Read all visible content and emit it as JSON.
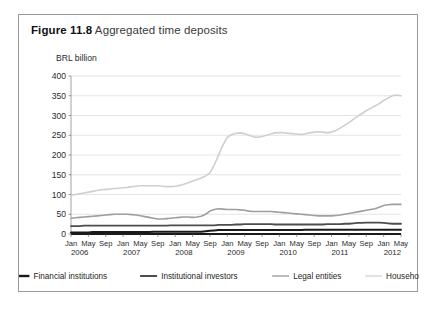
{
  "figure": {
    "label": "Figure 11.8",
    "title": "Aggregated time deposits"
  },
  "chart_data": {
    "type": "line",
    "title": "Aggregated time deposits",
    "xlabel": "",
    "ylabel": "BRL billion",
    "ylim": [
      0,
      400
    ],
    "ytick_step": 50,
    "yticks": [
      "0",
      "50",
      "100",
      "150",
      "200",
      "250",
      "300",
      "350",
      "400"
    ],
    "grid": true,
    "legend_position": "bottom",
    "colors": {
      "financial_institutions": "#1a1a1a",
      "institutional_investors": "#4d4d4d",
      "legal_entities": "#9e9e9e",
      "households": "#cfcfcf"
    },
    "x_tick_labels": [
      "Jan",
      "May",
      "Sep",
      "Jan",
      "May",
      "Sep",
      "Jan",
      "May",
      "Sep",
      "Jan",
      "May",
      "Sep",
      "Jan",
      "May",
      "Sep",
      "Jan",
      "May",
      "Sep",
      "Jan",
      "May"
    ],
    "x_year_labels": [
      "2006",
      "2007",
      "2008",
      "2009",
      "2010",
      "2011",
      "2012"
    ],
    "x_range_start": "Jan 2006",
    "x_range_end": "May 2012",
    "x_months": [
      "Jan 2006",
      "Feb 2006",
      "Mar 2006",
      "Apr 2006",
      "May 2006",
      "Jun 2006",
      "Jul 2006",
      "Aug 2006",
      "Sep 2006",
      "Oct 2006",
      "Nov 2006",
      "Dec 2006",
      "Jan 2007",
      "Feb 2007",
      "Mar 2007",
      "Apr 2007",
      "May 2007",
      "Jun 2007",
      "Jul 2007",
      "Aug 2007",
      "Sep 2007",
      "Oct 2007",
      "Nov 2007",
      "Dec 2007",
      "Jan 2008",
      "Feb 2008",
      "Mar 2008",
      "Apr 2008",
      "May 2008",
      "Jun 2008",
      "Jul 2008",
      "Aug 2008",
      "Sep 2008",
      "Oct 2008",
      "Nov 2008",
      "Dec 2008",
      "Jan 2009",
      "Feb 2009",
      "Mar 2009",
      "Apr 2009",
      "May 2009",
      "Jun 2009",
      "Jul 2009",
      "Aug 2009",
      "Sep 2009",
      "Oct 2009",
      "Nov 2009",
      "Dec 2009",
      "Jan 2010",
      "Feb 2010",
      "Mar 2010",
      "Apr 2010",
      "May 2010",
      "Jun 2010",
      "Jul 2010",
      "Aug 2010",
      "Sep 2010",
      "Oct 2010",
      "Nov 2010",
      "Dec 2010",
      "Jan 2011",
      "Feb 2011",
      "Mar 2011",
      "Apr 2011",
      "May 2011",
      "Jun 2011",
      "Jul 2011",
      "Aug 2011",
      "Sep 2011",
      "Oct 2011",
      "Nov 2011",
      "Dec 2011",
      "Jan 2012",
      "Feb 2012",
      "Mar 2012",
      "Apr 2012",
      "May 2012"
    ],
    "series": [
      {
        "name": "Financial institutions",
        "color": "#1a1a1a",
        "width": 2.0,
        "values": [
          4,
          4,
          4,
          4,
          4,
          5,
          5,
          5,
          5,
          5,
          5,
          5,
          5,
          5,
          5,
          5,
          5,
          5,
          5,
          6,
          6,
          6,
          6,
          6,
          6,
          6,
          6,
          6,
          6,
          6,
          6,
          7,
          8,
          9,
          10,
          10,
          10,
          10,
          10,
          10,
          10,
          10,
          10,
          10,
          10,
          10,
          10,
          10,
          10,
          10,
          10,
          10,
          10,
          10,
          11,
          11,
          11,
          11,
          11,
          11,
          11,
          11,
          11,
          11,
          11,
          11,
          11,
          11,
          11,
          11,
          11,
          11,
          11,
          11,
          11,
          11,
          11
        ]
      },
      {
        "name": "Institutional investors",
        "color": "#4d4d4d",
        "width": 1.8,
        "values": [
          20,
          20,
          20,
          21,
          21,
          21,
          21,
          21,
          21,
          21,
          21,
          21,
          21,
          21,
          21,
          21,
          21,
          21,
          21,
          21,
          21,
          21,
          21,
          22,
          22,
          22,
          22,
          22,
          22,
          22,
          22,
          22,
          22,
          22,
          23,
          23,
          23,
          23,
          24,
          24,
          25,
          25,
          25,
          25,
          25,
          25,
          25,
          24,
          24,
          24,
          24,
          24,
          24,
          24,
          24,
          24,
          24,
          24,
          24,
          25,
          25,
          25,
          25,
          26,
          26,
          27,
          28,
          28,
          29,
          29,
          29,
          29,
          28,
          27,
          26,
          26,
          26
        ]
      },
      {
        "name": "Legal entities",
        "color": "#9e9e9e",
        "width": 1.6,
        "values": [
          40,
          41,
          42,
          43,
          44,
          45,
          46,
          47,
          48,
          49,
          50,
          50,
          50,
          50,
          49,
          48,
          46,
          44,
          42,
          40,
          38,
          38,
          39,
          40,
          41,
          42,
          43,
          43,
          42,
          43,
          45,
          50,
          58,
          62,
          64,
          63,
          62,
          62,
          62,
          61,
          60,
          58,
          57,
          57,
          57,
          57,
          57,
          56,
          55,
          54,
          53,
          52,
          51,
          50,
          49,
          48,
          47,
          46,
          46,
          46,
          46,
          47,
          48,
          50,
          52,
          54,
          56,
          58,
          60,
          62,
          64,
          68,
          72,
          74,
          75,
          75,
          75
        ]
      },
      {
        "name": "Households",
        "color": "#cfcfcf",
        "width": 1.6,
        "values": [
          98,
          100,
          102,
          104,
          106,
          108,
          110,
          112,
          113,
          114,
          115,
          116,
          117,
          118,
          120,
          121,
          122,
          122,
          122,
          122,
          122,
          121,
          120,
          120,
          121,
          123,
          126,
          130,
          134,
          138,
          142,
          147,
          155,
          175,
          200,
          225,
          245,
          252,
          255,
          256,
          254,
          250,
          246,
          245,
          247,
          250,
          253,
          256,
          257,
          256,
          255,
          254,
          253,
          252,
          254,
          256,
          258,
          259,
          258,
          256,
          258,
          262,
          268,
          275,
          282,
          290,
          298,
          305,
          312,
          318,
          324,
          330,
          338,
          344,
          350,
          352,
          350
        ]
      }
    ]
  },
  "legend": [
    {
      "label": "Financial institutions",
      "color": "#1a1a1a",
      "width": 2.4
    },
    {
      "label": "Institutional investors",
      "color": "#4d4d4d",
      "width": 2.0
    },
    {
      "label": "Legal entities",
      "color": "#9e9e9e",
      "width": 1.4
    },
    {
      "label": "Households",
      "color": "#d6d6d6",
      "width": 1.4
    }
  ]
}
